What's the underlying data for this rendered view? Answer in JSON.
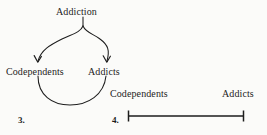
{
  "figures": [
    {
      "number": "3.",
      "type": "cycle-diagram",
      "source_label": "Addiction",
      "left_label": "Codependents",
      "right_label": "Addicts"
    },
    {
      "number": "4.",
      "type": "spectrum-line",
      "left_label": "Codependents",
      "right_label": "Addicts"
    }
  ],
  "colors": {
    "ink": "#1d1d1d",
    "page": "#fbfbf9"
  }
}
